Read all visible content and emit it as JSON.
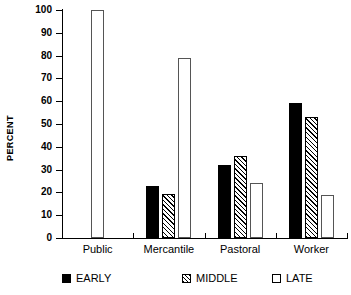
{
  "chart_data": {
    "type": "bar",
    "title": "",
    "subtitle": "",
    "xlabel": "",
    "ylabel": "PERCENT",
    "ylim": [
      0,
      100
    ],
    "yticks": [
      0,
      10,
      20,
      30,
      40,
      50,
      60,
      70,
      80,
      90,
      100
    ],
    "grid": false,
    "legend_position": "bottom",
    "categories": [
      "Public",
      "Mercantile",
      "Pastoral",
      "Worker"
    ],
    "series": [
      {
        "name": "EARLY",
        "style": "solid-black",
        "values": [
          null,
          23,
          32,
          59
        ]
      },
      {
        "name": "MIDDLE",
        "style": "diagonal-hatch",
        "values": [
          null,
          19.5,
          36,
          53
        ]
      },
      {
        "name": "LATE",
        "style": "white-outline",
        "values": [
          100,
          79,
          24,
          19
        ]
      }
    ]
  },
  "axis": {
    "y_title": "PERCENT",
    "tick_labels": [
      "100",
      "90",
      "80",
      "70",
      "60",
      "50",
      "40",
      "30",
      "20",
      "10",
      "0"
    ]
  },
  "groups": [
    {
      "label": "Public"
    },
    {
      "label": "Mercantile"
    },
    {
      "label": "Pastoral"
    },
    {
      "label": "Worker"
    }
  ],
  "legend": {
    "items": [
      {
        "label": "EARLY",
        "swatch": "filled-square-icon"
      },
      {
        "label": "MIDDLE",
        "swatch": "hatched-square-icon"
      },
      {
        "label": "LATE",
        "swatch": "empty-square-icon"
      }
    ]
  },
  "colors": {
    "early": "#000000",
    "middle": "#ffffff",
    "late": "#ffffff",
    "axis": "#000000",
    "background": "#ffffff"
  }
}
